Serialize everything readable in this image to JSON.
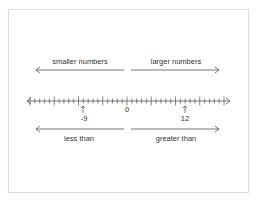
{
  "diagram": {
    "top_labels": {
      "left": "smaller numbers",
      "right": "larger numbers"
    },
    "bottom_labels": {
      "left": "less than",
      "right": "greater than"
    },
    "number_line": {
      "min": -20,
      "max": 20,
      "minor_step": 1,
      "major_step": 5,
      "zero_label": "0",
      "markers": [
        {
          "value": -9,
          "label": "-9"
        },
        {
          "value": 12,
          "label": "12"
        }
      ]
    },
    "colors": {
      "line": "#555555",
      "text": "#333333",
      "border": "#dcdcdc"
    }
  }
}
